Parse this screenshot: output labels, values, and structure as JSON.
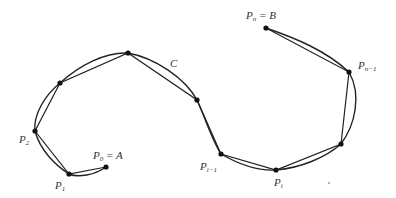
{
  "diagram": {
    "curve_label": "C",
    "labels": {
      "p0": {
        "base": "P",
        "sub": "0",
        "suffix": " = A"
      },
      "p1": {
        "base": "P",
        "sub": "1"
      },
      "p2": {
        "base": "P",
        "sub": "2"
      },
      "pim1": {
        "base": "P",
        "sub": "i−1"
      },
      "pi": {
        "base": "P",
        "sub": "i"
      },
      "pnm1": {
        "base": "P",
        "sub": "n−1"
      },
      "pn": {
        "base": "P",
        "sub": "n",
        "suffix": " = B"
      }
    },
    "colors": {
      "stroke": "#222222",
      "point": "#111111"
    }
  }
}
